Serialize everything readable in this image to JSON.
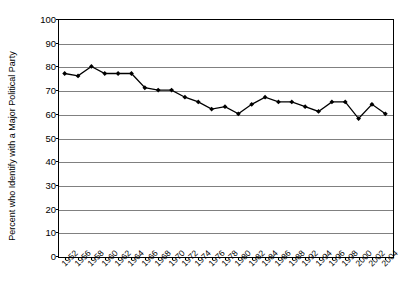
{
  "chart_data": {
    "type": "line",
    "title": "",
    "xlabel": "",
    "ylabel": "Percent who Identify with a Major Political Party",
    "ylim": [
      0,
      100
    ],
    "ytick_step": 10,
    "yticks": [
      100,
      90,
      80,
      70,
      60,
      50,
      40,
      30,
      20,
      10,
      0
    ],
    "grid": true,
    "legend": "none",
    "marker": "filled-diamond",
    "line_color": "#000000",
    "marker_color": "#000000",
    "gridline_color": "#808080",
    "categories": [
      "1952",
      "1956",
      "1958",
      "1960",
      "1962",
      "1964",
      "1966",
      "1968",
      "1970",
      "1972",
      "1974",
      "1976",
      "1978",
      "1980",
      "1982",
      "1984",
      "1986",
      "1988",
      "1992",
      "1994",
      "1996",
      "1998",
      "2000",
      "2002",
      "2004"
    ],
    "values": [
      77,
      76,
      80,
      77,
      77,
      77,
      71,
      70,
      70,
      67,
      65,
      62,
      63,
      60,
      64,
      67,
      65,
      65,
      63,
      61,
      65,
      65,
      58,
      64,
      60
    ],
    "series": [
      {
        "name": "Percent who Identify with a Major Political Party",
        "values": [
          77,
          76,
          80,
          77,
          77,
          77,
          71,
          70,
          70,
          67,
          65,
          62,
          63,
          60,
          64,
          67,
          65,
          65,
          63,
          61,
          65,
          65,
          58,
          64,
          60
        ]
      }
    ]
  },
  "axes": {
    "y_title": "Percent who Identify with a Major Political Party",
    "y_labels": [
      "100",
      "90",
      "80",
      "70",
      "60",
      "50",
      "40",
      "30",
      "20",
      "10",
      "0"
    ],
    "x_labels": [
      "1952",
      "1956",
      "1958",
      "1960",
      "1962",
      "1964",
      "1966",
      "1968",
      "1970",
      "1972",
      "1974",
      "1976",
      "1978",
      "1980",
      "1982",
      "1984",
      "1986",
      "1988",
      "1992",
      "1994",
      "1996",
      "1998",
      "2000",
      "2002",
      "2004"
    ]
  }
}
